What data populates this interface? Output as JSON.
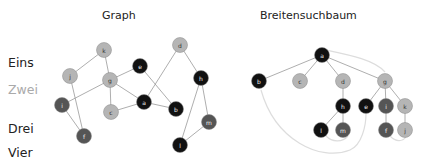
{
  "titles": {
    "graph": "Graph",
    "tree": "Breitensuchbaum"
  },
  "levels": [
    {
      "label": "Eins",
      "color": "#222222"
    },
    {
      "label": "Zwei",
      "color": "#aaaaaa"
    },
    {
      "label": "Drei",
      "color": "#222222"
    },
    {
      "label": "Vier",
      "color": "#222222"
    }
  ],
  "colors": {
    "black": "#111111",
    "dark": "#555555",
    "light": "#b5b5b5",
    "edge": "#999999",
    "back_edge": "#dddddd"
  },
  "graph": {
    "nodes": [
      {
        "id": "k",
        "x": 104,
        "y": 50,
        "shade": "light"
      },
      {
        "id": "j",
        "x": 70,
        "y": 76,
        "shade": "light"
      },
      {
        "id": "g",
        "x": 110,
        "y": 80,
        "shade": "light"
      },
      {
        "id": "e",
        "x": 140,
        "y": 66,
        "shade": "black"
      },
      {
        "id": "d",
        "x": 180,
        "y": 45,
        "shade": "light"
      },
      {
        "id": "h",
        "x": 201,
        "y": 78,
        "shade": "black"
      },
      {
        "id": "i",
        "x": 62,
        "y": 105,
        "shade": "dark"
      },
      {
        "id": "c",
        "x": 111,
        "y": 112,
        "shade": "light"
      },
      {
        "id": "a",
        "x": 144,
        "y": 102,
        "shade": "black"
      },
      {
        "id": "b",
        "x": 176,
        "y": 109,
        "shade": "black"
      },
      {
        "id": "m",
        "x": 209,
        "y": 122,
        "shade": "dark"
      },
      {
        "id": "f",
        "x": 84,
        "y": 136,
        "shade": "dark"
      },
      {
        "id": "l",
        "x": 180,
        "y": 145,
        "shade": "black"
      }
    ],
    "edges": [
      [
        "k",
        "j"
      ],
      [
        "k",
        "g"
      ],
      [
        "j",
        "f"
      ],
      [
        "i",
        "f"
      ],
      [
        "i",
        "g"
      ],
      [
        "g",
        "e"
      ],
      [
        "g",
        "c"
      ],
      [
        "g",
        "a"
      ],
      [
        "e",
        "b"
      ],
      [
        "c",
        "a"
      ],
      [
        "a",
        "b"
      ],
      [
        "a",
        "d"
      ],
      [
        "d",
        "h"
      ],
      [
        "h",
        "m"
      ],
      [
        "h",
        "l"
      ],
      [
        "l",
        "m"
      ]
    ]
  },
  "tree": {
    "nodes": [
      {
        "id": "a",
        "x": 322,
        "y": 55,
        "shade": "black"
      },
      {
        "id": "b",
        "x": 259,
        "y": 81,
        "shade": "black"
      },
      {
        "id": "c",
        "x": 300,
        "y": 81,
        "shade": "light"
      },
      {
        "id": "d",
        "x": 343,
        "y": 81,
        "shade": "light"
      },
      {
        "id": "g",
        "x": 385,
        "y": 81,
        "shade": "light"
      },
      {
        "id": "h",
        "x": 343,
        "y": 106,
        "shade": "black"
      },
      {
        "id": "e",
        "x": 366,
        "y": 106,
        "shade": "black"
      },
      {
        "id": "i",
        "x": 386,
        "y": 106,
        "shade": "dark"
      },
      {
        "id": "k",
        "x": 405,
        "y": 106,
        "shade": "light"
      },
      {
        "id": "l",
        "x": 321,
        "y": 130,
        "shade": "black"
      },
      {
        "id": "m",
        "x": 343,
        "y": 130,
        "shade": "dark"
      },
      {
        "id": "f",
        "x": 386,
        "y": 130,
        "shade": "dark"
      },
      {
        "id": "j",
        "x": 405,
        "y": 130,
        "shade": "light"
      }
    ],
    "edges": [
      [
        "a",
        "b"
      ],
      [
        "a",
        "c"
      ],
      [
        "a",
        "d"
      ],
      [
        "a",
        "g"
      ],
      [
        "d",
        "h"
      ],
      [
        "h",
        "l"
      ],
      [
        "h",
        "m"
      ],
      [
        "g",
        "e"
      ],
      [
        "g",
        "i"
      ],
      [
        "g",
        "k"
      ],
      [
        "i",
        "f"
      ],
      [
        "k",
        "j"
      ]
    ],
    "back_edges": [
      "M 261 90 C 275 140, 320 162, 350 150 C 362 145, 366 125, 366 114",
      "M 326 50 C 350 55, 375 60, 385 72",
      "M 326 136 C 332 142, 342 143, 348 136",
      "M 390 136 C 396 142, 402 142, 406 137"
    ]
  }
}
